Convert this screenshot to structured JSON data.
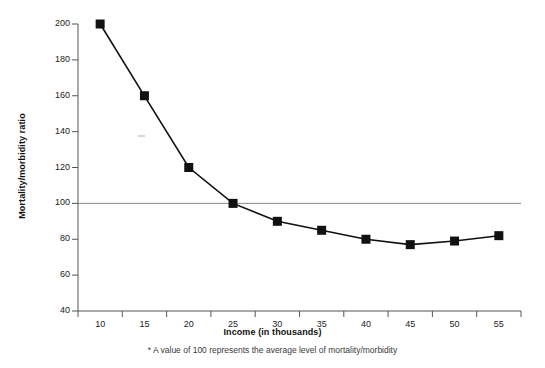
{
  "chart_data": {
    "type": "line",
    "title": "",
    "xlabel": "Income (in thousands)",
    "ylabel": "Mortality/morbidity ratio",
    "footnote": "* A value of 100 represents the average level of mortality/morbidity",
    "x": [
      10,
      15,
      20,
      25,
      30,
      35,
      40,
      45,
      50,
      55
    ],
    "values": [
      200,
      160,
      120,
      100,
      90,
      85,
      80,
      77,
      79,
      82
    ],
    "xlim": [
      7.5,
      57.5
    ],
    "ylim": [
      40,
      200
    ],
    "xticks": [
      10,
      15,
      20,
      25,
      30,
      35,
      40,
      45,
      50,
      55
    ],
    "yticks": [
      40,
      60,
      80,
      100,
      120,
      140,
      160,
      180,
      200
    ],
    "xtick_labels": [
      "10",
      "15",
      "20",
      "25",
      "30",
      "35",
      "40",
      "45",
      "50",
      "55"
    ],
    "ytick_labels": [
      "40",
      "60",
      "80",
      "100",
      "120",
      "140",
      "160",
      "180",
      "200"
    ],
    "grid": false,
    "legend": false,
    "reference_line": {
      "value": 100,
      "orientation": "horizontal",
      "color": "#888888"
    },
    "series": [
      {
        "name": "Mortality/morbidity ratio",
        "marker": "square",
        "color": "#111111",
        "values": [
          200,
          160,
          120,
          100,
          90,
          85,
          80,
          77,
          79,
          82
        ]
      }
    ]
  },
  "colors": {
    "line": "#111111",
    "marker": "#111111",
    "axis": "#555555",
    "reference": "#8a8a8a",
    "text": "#1a1a1a"
  }
}
